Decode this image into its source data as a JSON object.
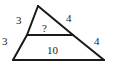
{
  "figure": {
    "name": "triangle-with-midsegment",
    "stroke_color": "#1a1a1a",
    "background_color": "#ffffff",
    "text_color": "#1a1a1a",
    "labels": {
      "left_upper": "3",
      "left_lower": "3",
      "right_upper": "4",
      "right_lower": "4",
      "base": "10",
      "midsegment": "?"
    },
    "vertices": {
      "apex": {
        "x": 38,
        "y": 6
      },
      "bottom_left": {
        "x": 13,
        "y": 60
      },
      "bottom_right": {
        "x": 104,
        "y": 60
      },
      "mid_left": {
        "x": 27,
        "y": 35
      },
      "mid_right": {
        "x": 73,
        "y": 35
      }
    },
    "segments": [
      {
        "name": "left-side-upper",
        "from": "apex",
        "to": "mid_left",
        "label": "3"
      },
      {
        "name": "left-side-lower",
        "from": "mid_left",
        "to": "bottom_left",
        "label": "3"
      },
      {
        "name": "right-side-upper",
        "from": "apex",
        "to": "mid_right",
        "label": "4"
      },
      {
        "name": "right-side-lower",
        "from": "mid_right",
        "to": "bottom_right",
        "label": "4"
      },
      {
        "name": "base",
        "from": "bottom_left",
        "to": "bottom_right",
        "label": "10"
      },
      {
        "name": "midsegment",
        "from": "mid_left",
        "to": "mid_right",
        "label": "?"
      }
    ]
  }
}
